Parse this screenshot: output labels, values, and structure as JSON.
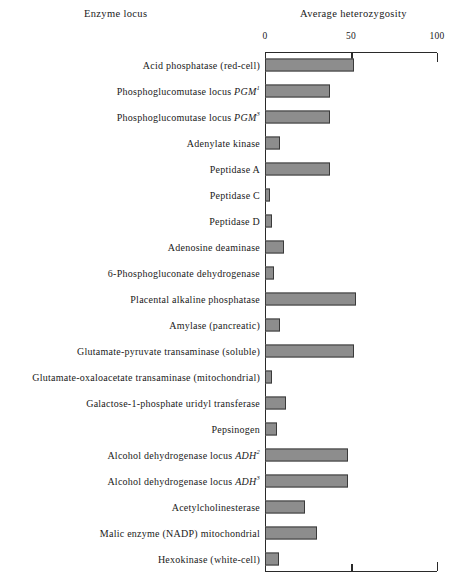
{
  "header": {
    "left_title": "Enzyme locus",
    "right_title": "Average heterozygosity"
  },
  "chart_data": {
    "type": "bar",
    "orientation": "horizontal",
    "title": "Average heterozygosity",
    "xlabel": "Average heterozygosity",
    "ylabel": "Enzyme locus",
    "xlim": [
      0,
      100
    ],
    "xticks": [
      0,
      50,
      100
    ],
    "xtick_labels": [
      "0",
      "50",
      "100"
    ],
    "grid": false,
    "legend": "none",
    "bar_color": "#8d8d8d",
    "bar_border_color": "#3a3a3a",
    "axis_color": "#2a2a2a",
    "categories": [
      "Acid phosphatase (red-cell)",
      "Phosphoglucomutase locus PGM1",
      "Phosphoglucomutase locus PGM3",
      "Adenylate kinase",
      "Peptidase A",
      "Peptidase C",
      "Peptidase D",
      "Adenosine deaminase",
      "6-Phosphogluconate dehydrogenase",
      "Placental alkaline phosphatase",
      "Amylase (pancreatic)",
      "Glutamate-pyruvate transaminase (soluble)",
      "Glutamate-oxaloacetate transaminase (mitochondrial)",
      "Galactose-1-phosphate uridyl transferase",
      "Pepsinogen",
      "Alcohol dehydrogenase locus ADH2",
      "Alcohol dehydrogenase locus ADH3",
      "Acetylcholinesterase",
      "Malic enzyme (NADP) mitochondrial",
      "Hexokinase (white-cell)"
    ],
    "values": [
      52,
      38,
      38,
      9,
      38,
      3,
      4,
      11,
      5,
      53,
      9,
      52,
      4,
      12,
      7,
      48,
      48,
      23,
      30,
      8
    ],
    "rows": [
      {
        "label_html": "Acid phosphatase (red-cell)",
        "value": 52
      },
      {
        "label_html": "Phosphoglucomutase locus <i>PGM</i><sup>1</sup>",
        "value": 38
      },
      {
        "label_html": "Phosphoglucomutase locus <i>PGM</i><sup>3</sup>",
        "value": 38
      },
      {
        "label_html": "Adenylate kinase",
        "value": 9
      },
      {
        "label_html": "Peptidase A",
        "value": 38
      },
      {
        "label_html": "Peptidase C",
        "value": 3
      },
      {
        "label_html": "Peptidase D",
        "value": 4
      },
      {
        "label_html": "Adenosine deaminase",
        "value": 11
      },
      {
        "label_html": "6-Phosphogluconate dehydrogenase",
        "value": 5
      },
      {
        "label_html": "Placental alkaline phosphatase",
        "value": 53
      },
      {
        "label_html": "Amylase (pancreatic)",
        "value": 9
      },
      {
        "label_html": "Glutamate-pyruvate transaminase (soluble)",
        "value": 52
      },
      {
        "label_html": "Glutamate-oxaloacetate transaminase (mitochondrial)",
        "value": 4
      },
      {
        "label_html": "Galactose-1-phosphate uridyl transferase",
        "value": 12
      },
      {
        "label_html": "Pepsinogen",
        "value": 7
      },
      {
        "label_html": "Alcohol dehydrogenase locus <i>ADH</i><sup>2</sup>",
        "value": 48
      },
      {
        "label_html": "Alcohol dehydrogenase locus <i>ADH</i><sup>3</sup>",
        "value": 48
      },
      {
        "label_html": "Acetylcholinesterase",
        "value": 23
      },
      {
        "label_html": "Malic enzyme (NADP) mitochondrial",
        "value": 30
      },
      {
        "label_html": "Hexokinase (white-cell)",
        "value": 8
      }
    ]
  }
}
